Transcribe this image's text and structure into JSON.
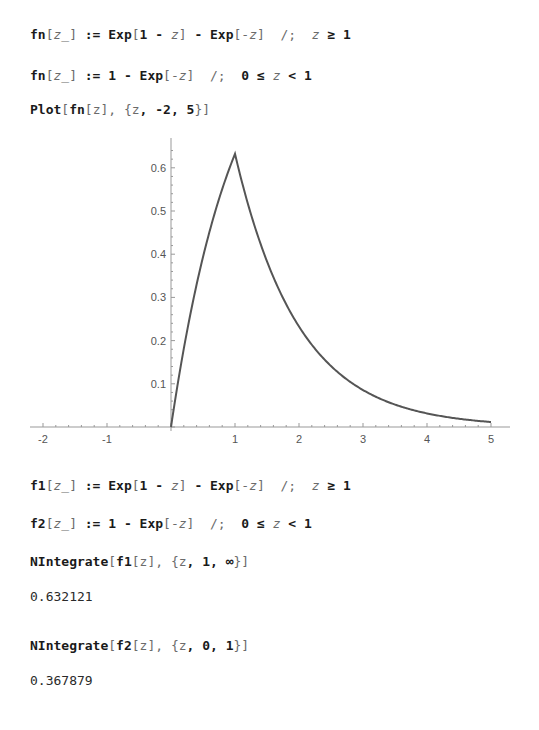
{
  "cells": [
    {
      "id": "def-fn-1",
      "type": "input",
      "top": 27,
      "parts": [
        {
          "t": "fn"
        },
        {
          "t": "[",
          "c": "g"
        },
        {
          "t": "z_",
          "c": "v"
        },
        {
          "t": "]",
          "c": "g"
        },
        {
          "t": " := Exp"
        },
        {
          "t": "[",
          "c": "g"
        },
        {
          "t": "1 - "
        },
        {
          "t": "z",
          "c": "v"
        },
        {
          "t": "]",
          "c": "g"
        },
        {
          "t": " - Exp"
        },
        {
          "t": "[-",
          "c": "g"
        },
        {
          "t": "z",
          "c": "v"
        },
        {
          "t": "]",
          "c": "g"
        },
        {
          "t": "  /;  ",
          "c": "g"
        },
        {
          "t": "z",
          "c": "v"
        },
        {
          "t": " ≥ 1"
        }
      ]
    },
    {
      "id": "def-fn-2",
      "type": "input",
      "top": 68,
      "parts": [
        {
          "t": "fn"
        },
        {
          "t": "[",
          "c": "g"
        },
        {
          "t": "z_",
          "c": "v"
        },
        {
          "t": "]",
          "c": "g"
        },
        {
          "t": " := 1 - Exp"
        },
        {
          "t": "[-",
          "c": "g"
        },
        {
          "t": "z",
          "c": "v"
        },
        {
          "t": "]",
          "c": "g"
        },
        {
          "t": "  /;  ",
          "c": "g"
        },
        {
          "t": "0 ≤ "
        },
        {
          "t": "z",
          "c": "v"
        },
        {
          "t": " < 1"
        }
      ]
    },
    {
      "id": "plot-cmd",
      "type": "input",
      "top": 102,
      "parts": [
        {
          "t": "Plot"
        },
        {
          "t": "[",
          "c": "g"
        },
        {
          "t": "fn"
        },
        {
          "t": "[",
          "c": "g"
        },
        {
          "t": "z",
          "c": "g"
        },
        {
          "t": "]",
          "c": "g"
        },
        {
          "t": ", {",
          "c": "g"
        },
        {
          "t": "z",
          "c": "g"
        },
        {
          "t": ", -2, 5"
        },
        {
          "t": "}]",
          "c": "g"
        }
      ]
    },
    {
      "id": "def-f1",
      "type": "input",
      "top": 478,
      "parts": [
        {
          "t": "f1"
        },
        {
          "t": "[",
          "c": "g"
        },
        {
          "t": "z_",
          "c": "v"
        },
        {
          "t": "]",
          "c": "g"
        },
        {
          "t": " := Exp"
        },
        {
          "t": "[",
          "c": "g"
        },
        {
          "t": "1 - "
        },
        {
          "t": "z",
          "c": "v"
        },
        {
          "t": "]",
          "c": "g"
        },
        {
          "t": " - Exp"
        },
        {
          "t": "[-",
          "c": "g"
        },
        {
          "t": "z",
          "c": "v"
        },
        {
          "t": "]",
          "c": "g"
        },
        {
          "t": "  /;  ",
          "c": "g"
        },
        {
          "t": "z",
          "c": "v"
        },
        {
          "t": " ≥ 1"
        }
      ]
    },
    {
      "id": "def-f2",
      "type": "input",
      "top": 516,
      "parts": [
        {
          "t": "f2"
        },
        {
          "t": "[",
          "c": "g"
        },
        {
          "t": "z_",
          "c": "v"
        },
        {
          "t": "]",
          "c": "g"
        },
        {
          "t": " := 1 - Exp"
        },
        {
          "t": "[-",
          "c": "g"
        },
        {
          "t": "z",
          "c": "v"
        },
        {
          "t": "]",
          "c": "g"
        },
        {
          "t": "  /;  ",
          "c": "g"
        },
        {
          "t": "0 ≤ "
        },
        {
          "t": "z",
          "c": "v"
        },
        {
          "t": " < 1"
        }
      ]
    },
    {
      "id": "nintegrate-f1",
      "type": "input",
      "top": 554,
      "parts": [
        {
          "t": "NIntegrate"
        },
        {
          "t": "[",
          "c": "g"
        },
        {
          "t": "f1"
        },
        {
          "t": "[",
          "c": "g"
        },
        {
          "t": "z",
          "c": "g"
        },
        {
          "t": "]",
          "c": "g"
        },
        {
          "t": ", {",
          "c": "g"
        },
        {
          "t": "z",
          "c": "g"
        },
        {
          "t": ", 1, ∞"
        },
        {
          "t": "}]",
          "c": "g"
        }
      ]
    },
    {
      "id": "result-f1",
      "type": "output",
      "top": 589,
      "parts": [
        {
          "t": "0.632121"
        }
      ]
    },
    {
      "id": "nintegrate-f2",
      "type": "input",
      "top": 638,
      "parts": [
        {
          "t": "NIntegrate"
        },
        {
          "t": "[",
          "c": "g"
        },
        {
          "t": "f2"
        },
        {
          "t": "[",
          "c": "g"
        },
        {
          "t": "z",
          "c": "g"
        },
        {
          "t": "]",
          "c": "g"
        },
        {
          "t": ", {",
          "c": "g"
        },
        {
          "t": "z",
          "c": "g"
        },
        {
          "t": ", 0, 1"
        },
        {
          "t": "}]",
          "c": "g"
        }
      ]
    },
    {
      "id": "result-f2",
      "type": "output",
      "top": 673,
      "parts": [
        {
          "t": "0.367879"
        }
      ]
    }
  ],
  "chart_data": {
    "type": "line",
    "title": "",
    "xlabel": "",
    "ylabel": "",
    "xlim": [
      -2,
      5
    ],
    "ylim": [
      0,
      0.65
    ],
    "x_ticks": [
      -2,
      -1,
      1,
      2,
      3,
      4,
      5
    ],
    "x_tick_labels": [
      "-2",
      "-1",
      "1",
      "2",
      "3",
      "4",
      "5"
    ],
    "y_ticks": [
      0.1,
      0.2,
      0.3,
      0.4,
      0.5,
      0.6
    ],
    "y_tick_labels": [
      "0.1",
      "0.2",
      "0.3",
      "0.4",
      "0.5",
      "0.6"
    ],
    "grid": false,
    "line_color": "#555555",
    "series": [
      {
        "name": "fn[z]",
        "x": [
          0,
          0.25,
          0.5,
          0.75,
          1,
          1.25,
          1.5,
          1.75,
          2,
          2.5,
          3,
          3.5,
          4,
          4.5,
          5
        ],
        "values": [
          0,
          0.221,
          0.393,
          0.528,
          0.632,
          0.492,
          0.383,
          0.298,
          0.233,
          0.141,
          0.086,
          0.052,
          0.031,
          0.019,
          0.012
        ]
      }
    ]
  }
}
